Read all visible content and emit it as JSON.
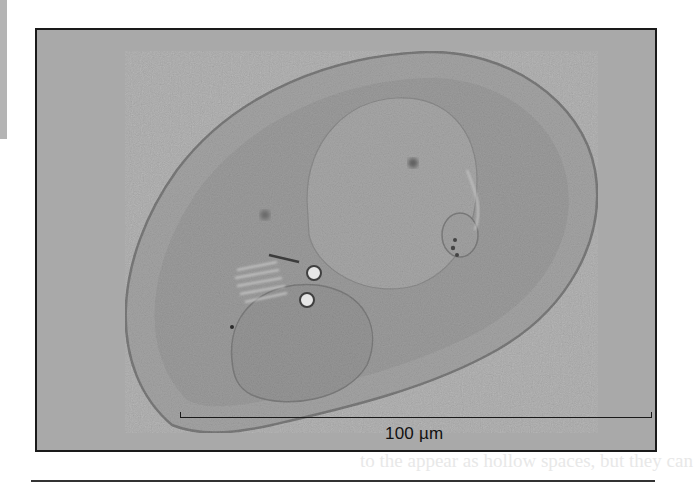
{
  "page": {
    "side_tab_color": "#b4b4b4",
    "rule_color": "#333333"
  },
  "figure": {
    "background_color": "#a9a9a9",
    "border_color": "#1a1a1a",
    "scale_bar": {
      "label": "100 µm"
    }
  },
  "bleed_through_text": "to the appear as hollow spaces, but they can"
}
